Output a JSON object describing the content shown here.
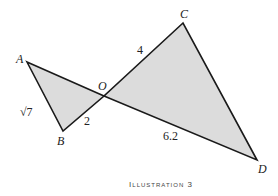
{
  "diagram": {
    "points": {
      "A": {
        "label": "A",
        "x": 27,
        "y": 62
      },
      "B": {
        "label": "B",
        "x": 63,
        "y": 131
      },
      "O": {
        "label": "O",
        "x": 104,
        "y": 96
      },
      "C": {
        "label": "C",
        "x": 183,
        "y": 23
      },
      "D": {
        "label": "D",
        "x": 257,
        "y": 160
      }
    },
    "triangles": [
      {
        "name": "AOB",
        "vertices": [
          "A",
          "O",
          "B"
        ]
      },
      {
        "name": "COD",
        "vertices": [
          "C",
          "O",
          "D"
        ]
      }
    ],
    "side_labels": {
      "AB": "√7",
      "BO": "2",
      "OC": "4",
      "OD": "6.2"
    },
    "fill_color": "#dcdcdc",
    "stroke_color": "#1a1a1a",
    "caption": "Illustration 3"
  }
}
